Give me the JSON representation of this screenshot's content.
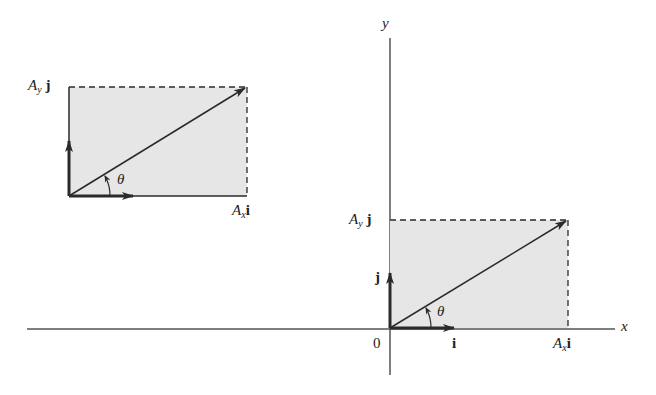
{
  "figure": {
    "colors": {
      "fill": "#e6e6e6",
      "stroke": "#2a2a2a"
    },
    "axes": {
      "x_label": "x",
      "y_label": "y",
      "origin_label": "0"
    },
    "left_diagram": {
      "ay_label": {
        "base": "A",
        "sub": "y",
        "unit": "j"
      },
      "ax_label": {
        "base": "A",
        "sub": "x",
        "unit": "i"
      },
      "angle_label": "θ"
    },
    "right_diagram": {
      "ay_label": {
        "base": "A",
        "sub": "y",
        "unit": "j"
      },
      "ax_label": {
        "base": "A",
        "sub": "x",
        "unit": "i"
      },
      "angle_label": "θ",
      "unit_i": "i",
      "unit_j": "j"
    }
  }
}
